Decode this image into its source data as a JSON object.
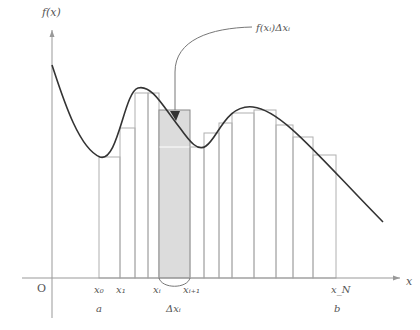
{
  "diagram": {
    "axes": {
      "y_label": "f(x)",
      "x_label": "x",
      "origin_label": "O"
    },
    "annotation": {
      "label": "f(x_i)Δx_i",
      "label_display": "f(xᵢ)Δxᵢ"
    },
    "x_ticks": [
      {
        "name": "x0",
        "display": "x₀",
        "x": 99
      },
      {
        "name": "x1",
        "display": "x₁",
        "x": 120
      },
      {
        "name": "xi",
        "display": "xᵢ",
        "x": 159
      },
      {
        "name": "xi1",
        "display": "xᵢ₊₁",
        "x": 190
      },
      {
        "name": "xN",
        "display": "x_N",
        "x": 336
      }
    ],
    "bounds": {
      "a": "a",
      "b": "b",
      "delta": "Δxᵢ"
    },
    "colors": {
      "curve": "#333333",
      "axis": "#999999",
      "rect_stroke": "#b0b0b0",
      "shaded_fill": "#dcdcdc",
      "text": "#555555"
    },
    "rectangles": [
      {
        "x": 99,
        "w": 21,
        "top": 157,
        "shaded": false
      },
      {
        "x": 120,
        "w": 15,
        "top": 128,
        "shaded": false
      },
      {
        "x": 135,
        "w": 13,
        "top": 93,
        "shaded": false
      },
      {
        "x": 148,
        "w": 11,
        "top": 93,
        "shaded": false
      },
      {
        "x": 159,
        "w": 31,
        "top": 110,
        "shaded": true
      },
      {
        "x": 190,
        "w": 14,
        "top": 147,
        "shaded": false
      },
      {
        "x": 204,
        "w": 15,
        "top": 133,
        "shaded": false
      },
      {
        "x": 219,
        "w": 13,
        "top": 123,
        "shaded": false
      },
      {
        "x": 232,
        "w": 22,
        "top": 113,
        "shaded": false
      },
      {
        "x": 254,
        "w": 22,
        "top": 110,
        "shaded": false
      },
      {
        "x": 276,
        "w": 17,
        "top": 125,
        "shaded": false
      },
      {
        "x": 293,
        "w": 20,
        "top": 137,
        "shaded": false
      },
      {
        "x": 313,
        "w": 23,
        "top": 155,
        "shaded": false
      }
    ]
  }
}
